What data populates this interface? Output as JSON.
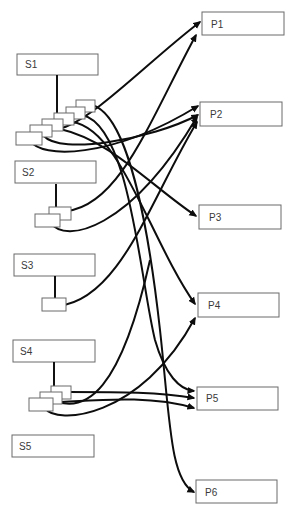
{
  "diagram": {
    "type": "bipartite-mapping",
    "sources": [
      {
        "id": "S1",
        "label": "S1",
        "ports": 6
      },
      {
        "id": "S2",
        "label": "S2",
        "ports": 2
      },
      {
        "id": "S3",
        "label": "S3",
        "ports": 1
      },
      {
        "id": "S4",
        "label": "S4",
        "ports": 3
      },
      {
        "id": "S5",
        "label": "S5",
        "ports": 0
      }
    ],
    "targets": [
      {
        "id": "P1",
        "label": "P1"
      },
      {
        "id": "P2",
        "label": "P2"
      },
      {
        "id": "P3",
        "label": "P3"
      },
      {
        "id": "P4",
        "label": "P4"
      },
      {
        "id": "P5",
        "label": "P5"
      },
      {
        "id": "P6",
        "label": "P6"
      }
    ],
    "edges": [
      {
        "from": "S1",
        "port": 1,
        "to": "P2"
      },
      {
        "from": "S1",
        "port": 2,
        "to": "P2"
      },
      {
        "from": "S1",
        "port": 3,
        "to": "P3"
      },
      {
        "from": "S1",
        "port": 4,
        "to": "P4"
      },
      {
        "from": "S1",
        "port": 5,
        "to": "P5"
      },
      {
        "from": "S1",
        "port": 6,
        "to": "P6"
      },
      {
        "from": "S2",
        "port": 1,
        "to": "P1"
      },
      {
        "from": "S2",
        "port": 2,
        "to": "P2"
      },
      {
        "from": "S3",
        "port": 1,
        "to": "P2"
      },
      {
        "from": "S4",
        "port": 1,
        "to": "P5"
      },
      {
        "from": "S4",
        "port": 2,
        "to": "P5"
      },
      {
        "from": "S4",
        "port": 3,
        "to": "P4"
      }
    ],
    "caption": ""
  },
  "colors": {
    "line": "#0d0d0d",
    "box_stroke": "#6a6a6a",
    "label": "#3a3a3a",
    "background": "#ffffff"
  }
}
